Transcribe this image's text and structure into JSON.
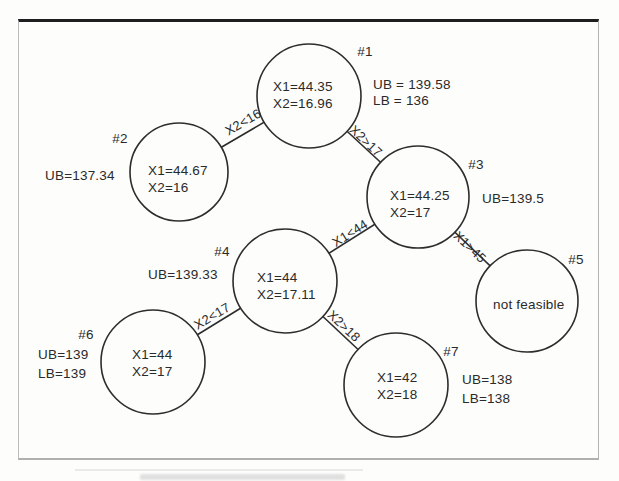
{
  "figure": {
    "kind": "branch-and-bound tree diagram (scanned textbook figure)",
    "colors": {
      "background": "#fdfdfc",
      "line": "#2d2d2d",
      "text": "#2a2a2a",
      "frame_top": "#1e1e1e",
      "frame_sides": "#b4b4b4"
    }
  },
  "nodes": [
    {
      "id": "#1",
      "line1": "X1=44.35",
      "line2": "X2=16.96",
      "side": [
        "UB = 139.58",
        "LB = 136"
      ]
    },
    {
      "id": "#2",
      "line1": "X1=44.67",
      "line2": "X2=16",
      "side": [
        "UB=137.34"
      ]
    },
    {
      "id": "#3",
      "line1": "X1=44.25",
      "line2": "X2=17",
      "side": [
        "UB=139.5"
      ]
    },
    {
      "id": "#4",
      "line1": "X1=44",
      "line2": "X2=17.11",
      "side": [
        "UB=139.33"
      ]
    },
    {
      "id": "#5",
      "line1": "not feasible",
      "line2": "",
      "side": []
    },
    {
      "id": "#6",
      "line1": "X1=44",
      "line2": "X2=17",
      "side": [
        "UB=139",
        "LB=139"
      ]
    },
    {
      "id": "#7",
      "line1": "X1=42",
      "line2": "X2=18",
      "side": [
        "UB=138",
        "LB=138"
      ]
    }
  ],
  "edges": [
    {
      "from": "#1",
      "to": "#2",
      "label": "X2<16"
    },
    {
      "from": "#1",
      "to": "#3",
      "label": "X2>17"
    },
    {
      "from": "#3",
      "to": "#4",
      "label": "X1<44"
    },
    {
      "from": "#3",
      "to": "#5",
      "label": "X1>45"
    },
    {
      "from": "#4",
      "to": "#6",
      "label": "X2<17"
    },
    {
      "from": "#4",
      "to": "#7",
      "label": "X2>18"
    }
  ]
}
